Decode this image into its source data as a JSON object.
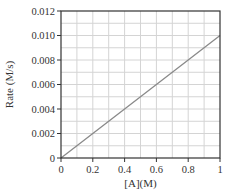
{
  "chart_data": {
    "type": "line",
    "title": "",
    "xlabel": "[A](M)",
    "ylabel": "Rate (M/s)",
    "xlim": [
      0,
      1
    ],
    "ylim": [
      0,
      0.012
    ],
    "xticks": [
      0,
      0.2,
      0.4,
      0.6,
      0.8,
      1
    ],
    "xtick_labels": [
      "0",
      "0.2",
      "0.4",
      "0.6",
      "0.8",
      "1"
    ],
    "yticks": [
      0,
      0.002,
      0.004,
      0.006,
      0.008,
      0.01,
      0.012
    ],
    "ytick_labels": [
      "0",
      "0.002",
      "0.004",
      "0.006",
      "0.008",
      "0.010",
      "0.012"
    ],
    "grid": true,
    "grid_x_step": 0.1,
    "grid_y_step": 0.001,
    "legend": null,
    "series": [
      {
        "name": "Rate vs [A]",
        "x": [
          0,
          0.2,
          0.4,
          0.6,
          0.8,
          1.0
        ],
        "y": [
          0,
          0.002,
          0.004,
          0.006,
          0.008,
          0.01
        ],
        "color": "#8a8a8a"
      }
    ]
  },
  "colors": {
    "frame": "#333333",
    "grid": "#d4d4d4",
    "line": "#8a8a8a",
    "text": "#333333"
  }
}
